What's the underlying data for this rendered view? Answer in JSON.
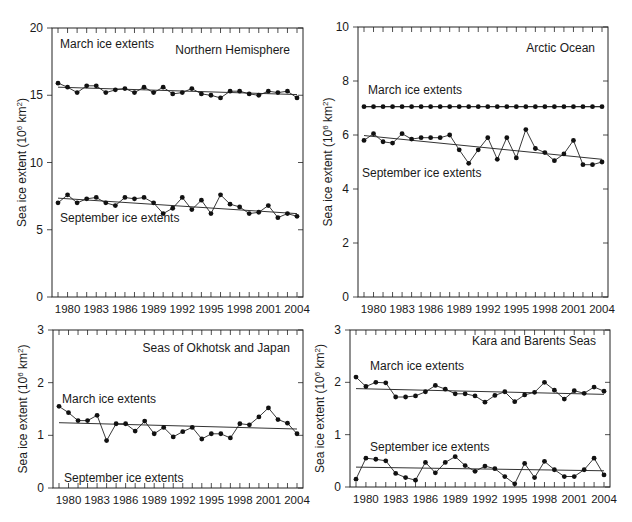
{
  "chart_data": [
    {
      "type": "line",
      "title": "Northern Hemisphere",
      "xlabel": "",
      "ylabel": "Sea ice extent (10^6 km^2)",
      "ylim": [
        0,
        20
      ],
      "yticks": [
        0,
        5,
        10,
        15,
        20
      ],
      "xtick_labels": [
        "1980",
        "1983",
        "1986",
        "1989",
        "1992",
        "1995",
        "1998",
        "2001",
        "2004"
      ],
      "x": [
        1979,
        1980,
        1981,
        1982,
        1983,
        1984,
        1985,
        1986,
        1987,
        1988,
        1989,
        1990,
        1991,
        1992,
        1993,
        1994,
        1995,
        1996,
        1997,
        1998,
        1999,
        2000,
        2001,
        2002,
        2003,
        2004
      ],
      "grid": false,
      "series": [
        {
          "name": "March ice extents",
          "label_pos": [
            60,
            48
          ],
          "values": [
            15.9,
            15.6,
            15.2,
            15.7,
            15.7,
            15.2,
            15.4,
            15.5,
            15.2,
            15.6,
            15.2,
            15.6,
            15.1,
            15.2,
            15.5,
            15.1,
            15.0,
            14.8,
            15.3,
            15.3,
            15.1,
            15.0,
            15.3,
            15.2,
            15.3,
            14.8
          ],
          "trend": [
            15.6,
            15.05
          ]
        },
        {
          "name": "September ice extents",
          "label_pos": [
            60,
            222
          ],
          "values": [
            7.0,
            7.6,
            7.0,
            7.3,
            7.4,
            7.0,
            6.8,
            7.4,
            7.3,
            7.4,
            7.0,
            6.2,
            6.6,
            7.4,
            6.5,
            7.2,
            6.2,
            7.6,
            6.9,
            6.7,
            6.2,
            6.3,
            6.8,
            5.9,
            6.2,
            6.0
          ],
          "trend": [
            7.35,
            6.2
          ]
        }
      ]
    },
    {
      "type": "line",
      "title": "Arctic Ocean",
      "xlabel": "",
      "ylabel": "Sea ice extent (10^6 km^2)",
      "ylim": [
        0,
        10
      ],
      "yticks": [
        0,
        2,
        4,
        6,
        8,
        10
      ],
      "xtick_labels": [
        "1980",
        "1983",
        "1986",
        "1989",
        "1992",
        "1995",
        "1998",
        "2001",
        "2004"
      ],
      "x": [
        1979,
        1980,
        1981,
        1982,
        1983,
        1984,
        1985,
        1986,
        1987,
        1988,
        1989,
        1990,
        1991,
        1992,
        1993,
        1994,
        1995,
        1996,
        1997,
        1998,
        1999,
        2000,
        2001,
        2002,
        2003,
        2004
      ],
      "grid": false,
      "series": [
        {
          "name": "March ice extents",
          "label_pos": [
            368,
            94
          ],
          "values": [
            7.05,
            7.05,
            7.05,
            7.05,
            7.05,
            7.05,
            7.05,
            7.05,
            7.05,
            7.05,
            7.05,
            7.05,
            7.05,
            7.05,
            7.05,
            7.05,
            7.05,
            7.05,
            7.05,
            7.05,
            7.05,
            7.05,
            7.05,
            7.05,
            7.05,
            7.05
          ],
          "trend": [
            7.05,
            7.05
          ]
        },
        {
          "name": "September ice extents",
          "label_pos": [
            362,
            177
          ],
          "values": [
            5.8,
            6.05,
            5.75,
            5.7,
            6.05,
            5.85,
            5.9,
            5.9,
            5.9,
            6.0,
            5.45,
            4.95,
            5.45,
            5.9,
            5.1,
            5.9,
            5.15,
            6.2,
            5.5,
            5.35,
            5.05,
            5.3,
            5.8,
            4.9,
            4.9,
            5.0
          ],
          "trend": [
            5.98,
            5.1
          ]
        }
      ]
    },
    {
      "type": "line",
      "title": "Seas of Okhotsk and Japan",
      "xlabel": "",
      "ylabel": "Sea ice extent (10^6 km^2)",
      "ylim": [
        0,
        3
      ],
      "yticks": [
        0,
        1,
        2,
        3
      ],
      "xtick_labels": [
        "1980",
        "1983",
        "1986",
        "1989",
        "1992",
        "1995",
        "1998",
        "2001",
        "2004"
      ],
      "x": [
        1979,
        1980,
        1981,
        1982,
        1983,
        1984,
        1985,
        1986,
        1987,
        1988,
        1989,
        1990,
        1991,
        1992,
        1993,
        1994,
        1995,
        1996,
        1997,
        1998,
        1999,
        2000,
        2001,
        2002,
        2003,
        2004
      ],
      "grid": false,
      "series": [
        {
          "name": "March ice extents",
          "label_pos": [
            62,
            403
          ],
          "values": [
            1.55,
            1.43,
            1.28,
            1.28,
            1.38,
            0.9,
            1.22,
            1.22,
            1.08,
            1.27,
            1.03,
            1.15,
            0.97,
            1.07,
            1.15,
            0.93,
            1.03,
            1.03,
            0.95,
            1.22,
            1.2,
            1.35,
            1.52,
            1.3,
            1.23,
            1.03
          ],
          "trend": [
            1.24,
            1.12
          ]
        },
        {
          "name": "September ice extents",
          "label_pos": [
            64,
            482
          ],
          "values": [],
          "trend": []
        }
      ]
    },
    {
      "type": "line",
      "title": "Kara and Barents Seas",
      "xlabel": "",
      "ylabel": "Sea ice extent (10^6 km^2)",
      "ylim": [
        0,
        3
      ],
      "yticks": [
        0,
        1,
        2,
        3
      ],
      "xtick_labels": [
        "1980",
        "1983",
        "1986",
        "1989",
        "1992",
        "1995",
        "1998",
        "2001",
        "2004"
      ],
      "x": [
        1979,
        1980,
        1981,
        1982,
        1983,
        1984,
        1985,
        1986,
        1987,
        1988,
        1989,
        1990,
        1991,
        1992,
        1993,
        1994,
        1995,
        1996,
        1997,
        1998,
        1999,
        2000,
        2001,
        2002,
        2003,
        2004
      ],
      "grid": false,
      "series": [
        {
          "name": "March ice extents",
          "label_pos": [
            370,
            370
          ],
          "values": [
            2.1,
            1.92,
            2.0,
            1.99,
            1.72,
            1.72,
            1.74,
            1.82,
            1.94,
            1.87,
            1.78,
            1.78,
            1.74,
            1.62,
            1.75,
            1.82,
            1.63,
            1.76,
            1.81,
            2.0,
            1.85,
            1.68,
            1.84,
            1.79,
            1.91,
            1.83
          ],
          "trend": [
            1.88,
            1.77
          ]
        },
        {
          "name": "September ice extents",
          "label_pos": [
            370,
            451
          ],
          "values": [
            0.15,
            0.55,
            0.53,
            0.5,
            0.26,
            0.18,
            0.13,
            0.47,
            0.27,
            0.47,
            0.58,
            0.41,
            0.3,
            0.4,
            0.35,
            0.2,
            0.06,
            0.45,
            0.18,
            0.49,
            0.33,
            0.2,
            0.2,
            0.33,
            0.55,
            0.23
          ],
          "trend": [
            0.38,
            0.31
          ]
        }
      ]
    }
  ],
  "panels": [
    {
      "title": "Northern Hemisphere",
      "ylabel": "Sea ice extent (10",
      "ylabel_sup1": "6",
      "ylabel_mid": " km",
      "ylabel_sup2": "2",
      "ylabel_end": ")"
    },
    {
      "title": "Arctic Ocean",
      "ylabel": "Sea ice extent (10",
      "ylabel_sup1": "6",
      "ylabel_mid": " km",
      "ylabel_sup2": "2",
      "ylabel_end": ")"
    },
    {
      "title": "Seas of Okhotsk and Japan",
      "ylabel": "Sea ice extent (10",
      "ylabel_sup1": "6",
      "ylabel_mid": " km",
      "ylabel_sup2": "2",
      "ylabel_end": ")"
    },
    {
      "title": "Kara and Barents Seas",
      "ylabel": "Sea ice extent (10",
      "ylabel_sup1": "6",
      "ylabel_mid": " km",
      "ylabel_sup2": "2",
      "ylabel_end": ")"
    }
  ]
}
